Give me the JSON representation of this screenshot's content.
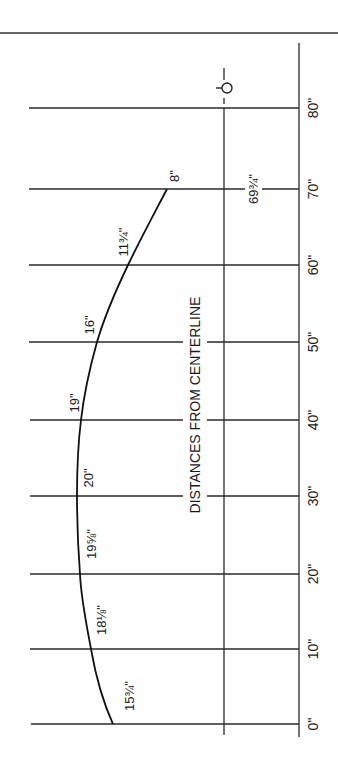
{
  "diagram": {
    "title": "DISTANCES FROM CENTERLINE",
    "centerline_symbol": "℄",
    "stations": [
      {
        "label": "0\"",
        "y": 724,
        "curve_x": 113,
        "value_label": "15¾\""
      },
      {
        "label": "10\"",
        "y": 649,
        "curve_x": 91,
        "value_label": "18⅛\""
      },
      {
        "label": "20\"",
        "y": 574,
        "curve_x": 80,
        "value_label": "19⅝\""
      },
      {
        "label": "30\"",
        "y": 496,
        "curve_x": 77,
        "value_label": "20\""
      },
      {
        "label": "40\"",
        "y": 420,
        "curve_x": 81,
        "value_label": "19\""
      },
      {
        "label": "50\"",
        "y": 342,
        "curve_x": 97,
        "value_label": "16\""
      },
      {
        "label": "60\"",
        "y": 265,
        "curve_x": 128,
        "value_label": "11¾\""
      },
      {
        "label": "70\"",
        "y": 189,
        "curve_x": 167,
        "value_label": "8\""
      },
      {
        "label": "80\"",
        "y": 108
      }
    ],
    "end_label": "69¾\"",
    "colors": {
      "line": "#2a2a2a",
      "background": "#ffffff"
    }
  }
}
